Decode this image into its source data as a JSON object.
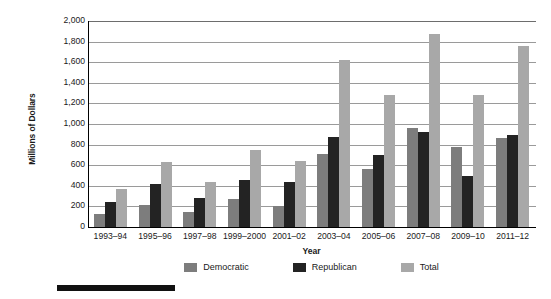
{
  "chart_data": {
    "type": "bar",
    "title": "",
    "xlabel": "Year",
    "ylabel": "Millions of Dollars",
    "ylim": [
      0,
      2000
    ],
    "ytick_step": 200,
    "grid": true,
    "legend_position": "bottom",
    "categories": [
      "1993–94",
      "1995–96",
      "1997–98",
      "1999–2000",
      "2001–02",
      "2003–04",
      "2005–06",
      "2007–08",
      "2009–10",
      "2011–12"
    ],
    "ytick_labels": [
      "2,000",
      "1,800",
      "1,600",
      "1,400",
      "1,200",
      "1,000",
      "800",
      "600",
      "400",
      "200",
      "0"
    ],
    "series": [
      {
        "name": "Democratic",
        "color": "#7d7d7d",
        "values": [
          130,
          215,
          150,
          270,
          205,
          710,
          560,
          960,
          780,
          860
        ]
      },
      {
        "name": "Republican",
        "color": "#232323",
        "values": [
          240,
          415,
          285,
          455,
          440,
          875,
          700,
          920,
          500,
          890
        ]
      },
      {
        "name": "Total",
        "color": "#a8a8a8",
        "values": [
          370,
          630,
          435,
          750,
          645,
          1620,
          1280,
          1870,
          1280,
          1760
        ]
      }
    ]
  },
  "legend": {
    "items": [
      {
        "label": "Democratic",
        "color": "#7d7d7d"
      },
      {
        "label": "Republican",
        "color": "#232323"
      },
      {
        "label": "Total",
        "color": "#a8a8a8"
      }
    ]
  },
  "axes": {
    "x_title": "Year",
    "y_title": "Millions of Dollars"
  }
}
